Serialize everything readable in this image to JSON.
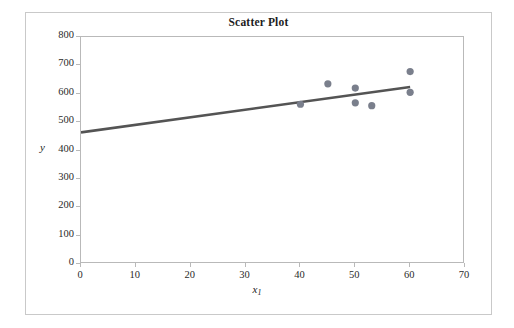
{
  "figure": {
    "title": "Scatter Plot",
    "equation_prefix": "y",
    "equation_hat": "^",
    "equation_body": " = 463.89 + 2.67",
    "equation_var": "x",
    "equation_sub": "1",
    "ylabel": "y",
    "xlabel_var": "x",
    "xlabel_sub": "1"
  },
  "colors": {
    "marker": "#7a7f8c",
    "trendline": "#545454",
    "axis": "#b9b9b9",
    "frame": "#c9c9c9",
    "text": "#1d1d1d"
  },
  "chart_data": {
    "type": "scatter",
    "title": "Scatter Plot",
    "xlabel": "x1",
    "ylabel": "y",
    "xlim": [
      0,
      70
    ],
    "ylim": [
      0,
      800
    ],
    "xticks": [
      0,
      10,
      20,
      30,
      40,
      50,
      60,
      70
    ],
    "yticks": [
      0,
      100,
      200,
      300,
      400,
      500,
      600,
      700,
      800
    ],
    "grid": false,
    "legend": false,
    "annotations": [
      {
        "text": "ŷ = 463.89 + 2.67x₁",
        "x": 6,
        "y": 690
      }
    ],
    "points": [
      {
        "x": 40,
        "y": 563
      },
      {
        "x": 45,
        "y": 635
      },
      {
        "x": 50,
        "y": 620
      },
      {
        "x": 50,
        "y": 568
      },
      {
        "x": 53,
        "y": 558
      },
      {
        "x": 60,
        "y": 678
      },
      {
        "x": 60,
        "y": 605
      }
    ],
    "series": [
      {
        "name": "observations",
        "type": "scatter",
        "x": [
          40,
          45,
          50,
          50,
          53,
          60,
          60
        ],
        "values": [
          563,
          635,
          620,
          568,
          558,
          678,
          605
        ]
      },
      {
        "name": "regression line",
        "type": "line",
        "equation": "yhat = 463.89 + 2.67 * x1",
        "intercept": 463.89,
        "slope": 2.67,
        "x": [
          0,
          60
        ],
        "values": [
          463.89,
          624.09
        ]
      }
    ]
  }
}
